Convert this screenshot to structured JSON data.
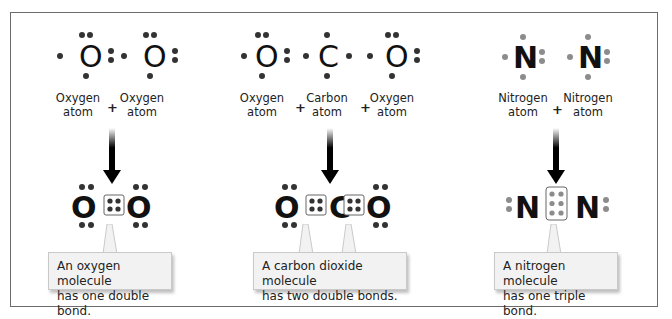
{
  "panels": [
    {
      "id": "oxygen",
      "reactants": [
        {
          "symbol": "O",
          "label_line1": "Oxygen",
          "label_line2": "atom"
        },
        {
          "symbol": "O",
          "label_line1": "Oxygen",
          "label_line2": "atom"
        }
      ],
      "operators": [
        "+"
      ],
      "product": {
        "formula": "O=O",
        "bond": "double",
        "shared_electrons": 4
      },
      "callout": {
        "line1": "An oxygen molecule",
        "line2": "has one double bond."
      }
    },
    {
      "id": "carbon-dioxide",
      "reactants": [
        {
          "symbol": "O",
          "label_line1": "Oxygen",
          "label_line2": "atom"
        },
        {
          "symbol": "C",
          "label_line1": "Carbon",
          "label_line2": "atom"
        },
        {
          "symbol": "O",
          "label_line1": "Oxygen",
          "label_line2": "atom"
        }
      ],
      "operators": [
        "+",
        "+"
      ],
      "product": {
        "formula": "O=C=O",
        "bond": "two double",
        "shared_electrons": 8
      },
      "callout": {
        "line1": "A carbon dioxide molecule",
        "line2": "has two double bonds."
      }
    },
    {
      "id": "nitrogen",
      "reactants": [
        {
          "symbol": "N",
          "label_line1": "Nitrogen",
          "label_line2": "atom"
        },
        {
          "symbol": "N",
          "label_line1": "Nitrogen",
          "label_line2": "atom"
        }
      ],
      "operators": [
        "+"
      ],
      "product": {
        "formula": "N≡N",
        "bond": "triple",
        "shared_electrons": 6
      },
      "callout": {
        "line1": "A nitrogen molecule",
        "line2": "has one triple bond."
      }
    }
  ],
  "colors": {
    "frame_border": "#6b6b6b",
    "electron_dark": "#333333",
    "electron_gray": "#8c8c8c",
    "callout_bg": "#f2f2f2",
    "text": "#222222"
  }
}
